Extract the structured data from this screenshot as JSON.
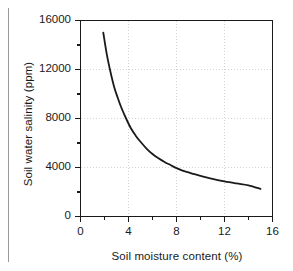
{
  "figure": {
    "background_color": "#ffffff",
    "axis_color": "#1a1a1a",
    "grid_color": "#c9c9c9",
    "curve_color": "#1a1a1a",
    "page_rule_color": "#9a9a9a"
  },
  "chart_data": {
    "type": "line",
    "title": "",
    "xlabel": "Soil moisture content (%)",
    "ylabel": "Soil water salinity (ppm)",
    "xlim": [
      0,
      16
    ],
    "ylim": [
      0,
      16000
    ],
    "xticks": [
      0,
      4,
      8,
      12,
      16
    ],
    "xtick_labels": [
      "0",
      "4",
      "8",
      "12",
      "16"
    ],
    "x_minor_ticks": [
      2,
      6,
      10,
      14
    ],
    "yticks": [
      0,
      4000,
      8000,
      12000,
      16000
    ],
    "ytick_labels": [
      "0",
      "4000",
      "8000",
      "12000",
      "16000"
    ],
    "y_minor_ticks": [
      2000,
      6000,
      10000,
      14000
    ],
    "grid": true,
    "grid_style": "dotted",
    "legend": null,
    "legend_position": "none",
    "series": [
      {
        "name": "Soil water salinity",
        "x": [
          1.9,
          2.2,
          2.5,
          2.8,
          3.1,
          3.4,
          3.8,
          4.2,
          4.6,
          5.0,
          5.5,
          6.0,
          6.5,
          7.0,
          7.5,
          8.0,
          8.5,
          9.0,
          9.5,
          10.0,
          11.0,
          12.0,
          13.0,
          14.0,
          15.0
        ],
        "y": [
          15000,
          13200,
          11800,
          10600,
          9700,
          8900,
          8000,
          7200,
          6600,
          6100,
          5550,
          5100,
          4750,
          4450,
          4200,
          3950,
          3750,
          3600,
          3450,
          3320,
          3080,
          2870,
          2700,
          2550,
          2250
        ]
      }
    ]
  }
}
